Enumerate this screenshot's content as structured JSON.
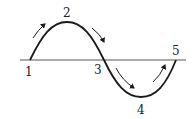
{
  "diagram": {
    "type": "sine-wave-cycle",
    "axis": {
      "y": 60,
      "x_start": 20,
      "x_end": 186
    },
    "points": [
      {
        "label": "1",
        "x": 30,
        "y": 60,
        "label_x": 25,
        "label_y": 76
      },
      {
        "label": "2",
        "x": 67,
        "y": 22,
        "label_x": 63,
        "label_y": 17
      },
      {
        "label": "3",
        "x": 104,
        "y": 60,
        "label_x": 94,
        "label_y": 74
      },
      {
        "label": "4",
        "x": 141,
        "y": 97,
        "label_x": 137,
        "label_y": 114
      },
      {
        "label": "5",
        "x": 176,
        "y": 60,
        "label_x": 172,
        "label_y": 55
      }
    ],
    "arrows": [
      {
        "from": "1",
        "to": "2",
        "direction": "up-right"
      },
      {
        "from": "2",
        "to": "3",
        "direction": "down-right"
      },
      {
        "from": "3",
        "to": "4",
        "direction": "down-right"
      },
      {
        "from": "4",
        "to": "5",
        "direction": "up-right"
      }
    ],
    "colors": {
      "stroke": "#1a1a1a",
      "axis": "#555555"
    }
  }
}
